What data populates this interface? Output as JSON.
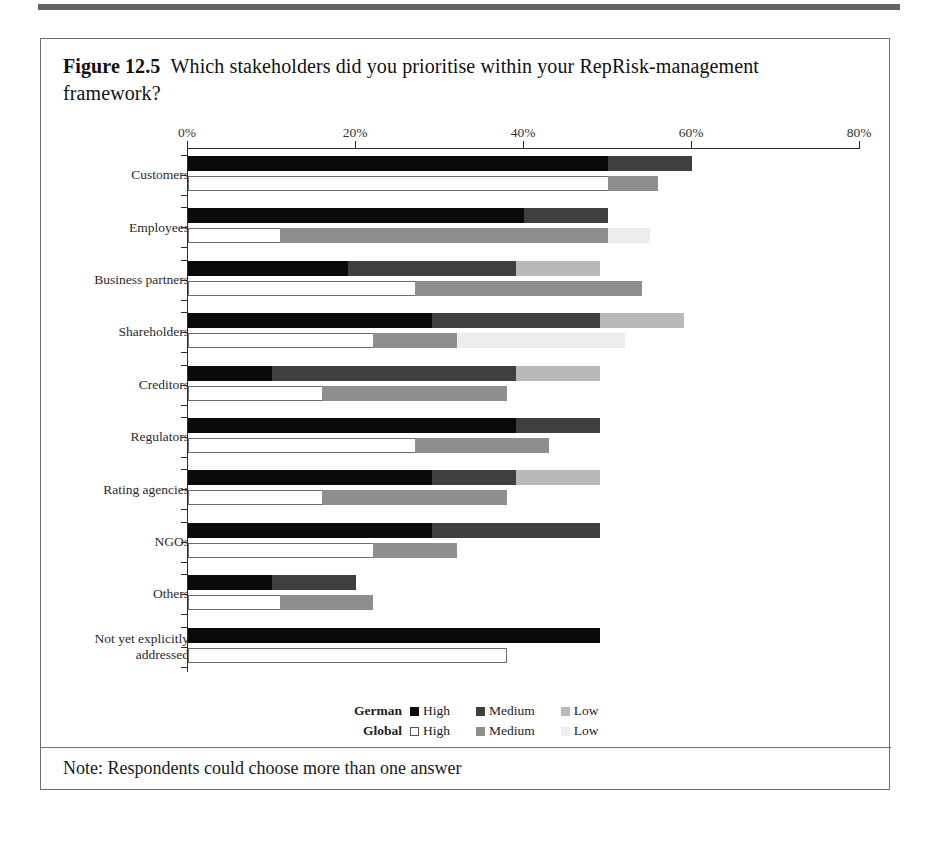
{
  "figure": {
    "number": "Figure 12.5",
    "caption": "Which stakeholders did you prioritise within your RepRisk-management framework?",
    "note": "Note: Respondents could choose more than one answer"
  },
  "legend": {
    "rows": [
      {
        "group": "German",
        "items": [
          {
            "label": "High",
            "swatch": "g-high",
            "color": "#0a0a0a"
          },
          {
            "label": "Medium",
            "swatch": "g-med",
            "color": "#3f3f3f"
          },
          {
            "label": "Low",
            "swatch": "g-low",
            "color": "#b9b9b9"
          }
        ]
      },
      {
        "group": "Global",
        "items": [
          {
            "label": "High",
            "swatch": "w-high",
            "color": "#ffffff"
          },
          {
            "label": "Medium",
            "swatch": "w-med",
            "color": "#8e8e8e"
          },
          {
            "label": "Low",
            "swatch": "w-low",
            "color": "#ededed"
          }
        ]
      }
    ]
  },
  "chart_data": {
    "type": "bar",
    "orientation": "horizontal",
    "stacked": true,
    "title": "Which stakeholders did you prioritise within your RepRisk-management framework?",
    "xlabel": "",
    "ylabel": "",
    "xlim": [
      0,
      80
    ],
    "xtick_labels": [
      "0%",
      "20%",
      "40%",
      "60%",
      "80%"
    ],
    "xticks": [
      0,
      20,
      40,
      60,
      80
    ],
    "grid": false,
    "legend_position": "bottom",
    "categories": [
      "Customers",
      "Employees",
      "Business partners",
      "Shareholders",
      "Creditors",
      "Regulators",
      "Rating agencies",
      "NGOs",
      "Others",
      "Not yet explicitly\naddressed"
    ],
    "series": [
      {
        "name": "German High",
        "group": "German",
        "level": "High",
        "values": [
          50,
          40,
          19,
          29,
          10,
          39,
          29,
          29,
          10,
          49
        ]
      },
      {
        "name": "German Medium",
        "group": "German",
        "level": "Medium",
        "values": [
          10,
          10,
          20,
          20,
          29,
          10,
          10,
          20,
          10,
          0
        ]
      },
      {
        "name": "German Low",
        "group": "German",
        "level": "Low",
        "values": [
          0,
          0,
          10,
          10,
          10,
          0,
          10,
          0,
          0,
          0
        ]
      },
      {
        "name": "Global High",
        "group": "Global",
        "level": "High",
        "values": [
          50,
          11,
          27,
          22,
          16,
          27,
          16,
          22,
          11,
          38
        ]
      },
      {
        "name": "Global Medium",
        "group": "Global",
        "level": "Medium",
        "values": [
          6,
          39,
          27,
          10,
          22,
          16,
          22,
          10,
          11,
          0
        ]
      },
      {
        "name": "Global Low",
        "group": "Global",
        "level": "Low",
        "values": [
          0,
          5,
          0,
          20,
          0,
          0,
          0,
          0,
          0,
          0
        ]
      }
    ]
  }
}
